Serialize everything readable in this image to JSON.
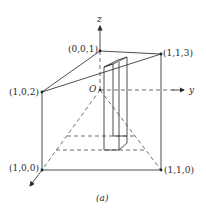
{
  "figure": {
    "caption": "(a)",
    "axes": {
      "z": "z",
      "y": "y",
      "origin": "O"
    },
    "points": [
      {
        "id": "p001",
        "label": "(0,0,1)"
      },
      {
        "id": "p113",
        "label": "(1,1,3)"
      },
      {
        "id": "p102",
        "label": "(1,0,2)"
      },
      {
        "id": "p100",
        "label": "(1,0,0)"
      },
      {
        "id": "p110",
        "label": "(1,1,0)"
      }
    ]
  }
}
